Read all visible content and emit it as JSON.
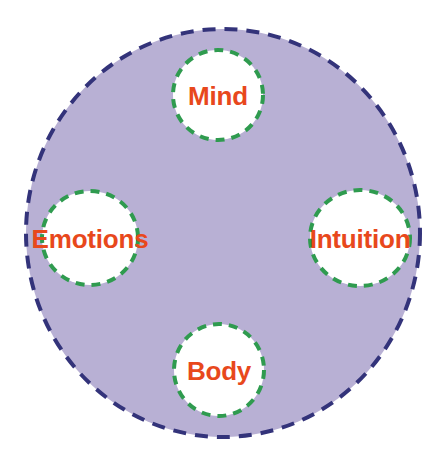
{
  "diagram": {
    "type": "venn-style-concept-circles",
    "canvas": {
      "width": 446,
      "height": 466,
      "background": "#ffffff"
    },
    "outer_circle": {
      "name": "self",
      "fill": "#b8b0d4",
      "border_color": "#33337a",
      "border_style": "dashed",
      "border_width": 4,
      "center_x": 223,
      "center_y": 233,
      "radius_x": 199,
      "radius_y": 206
    },
    "inner_circle_style": {
      "fill": "#ffffff",
      "border_color": "#2f9b4f",
      "border_style": "dashed",
      "border_width": 4
    },
    "label_color": "#e8481c",
    "nodes": [
      {
        "id": "mind",
        "label": "Mind",
        "center_x": 218,
        "center_y": 95,
        "radius_x": 47,
        "radius_y": 47,
        "position": "top"
      },
      {
        "id": "emotions",
        "label": "Emotions",
        "center_x": 90,
        "center_y": 238,
        "radius_x": 50,
        "radius_y": 49,
        "position": "left"
      },
      {
        "id": "intuition",
        "label": "Intuition",
        "center_x": 360,
        "center_y": 238,
        "radius_x": 52,
        "radius_y": 50,
        "position": "right"
      },
      {
        "id": "body",
        "label": "Body",
        "center_x": 219,
        "center_y": 370,
        "radius_x": 47,
        "radius_y": 48,
        "position": "bottom"
      }
    ]
  }
}
